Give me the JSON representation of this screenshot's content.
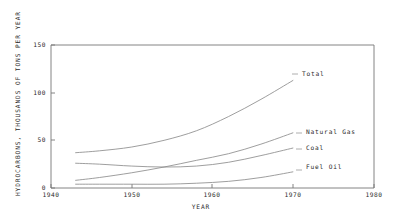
{
  "chart_data": {
    "type": "line",
    "title": "",
    "xlabel": "YEAR",
    "ylabel": "HYDROCARBONS, THOUSANDS OF TONS PER YEAR",
    "xlim": [
      1940,
      1980
    ],
    "ylim": [
      0,
      150
    ],
    "xticks": [
      1940,
      1950,
      1960,
      1970,
      1980
    ],
    "xtick_labels": [
      "1940",
      "1950",
      "1960",
      "1970",
      "1980"
    ],
    "yticks": [
      0,
      50,
      100,
      150
    ],
    "ytick_labels": [
      "0",
      "50",
      "100",
      "150"
    ],
    "grid": false,
    "legend_position": "inline-right-of-curve-ends",
    "series": [
      {
        "name": "Total",
        "label": "Total",
        "x": [
          1943,
          1946,
          1950,
          1954,
          1958,
          1962,
          1966,
          1970
        ],
        "values": [
          37,
          39,
          43,
          50,
          60,
          75,
          93,
          113
        ]
      },
      {
        "name": "Natural Gas",
        "label": "Natural Gas",
        "x": [
          1943,
          1946,
          1950,
          1954,
          1958,
          1962,
          1966,
          1970
        ],
        "values": [
          8,
          11,
          16,
          22,
          29,
          36,
          46,
          58
        ]
      },
      {
        "name": "Coal",
        "label": "Coal",
        "x": [
          1943,
          1946,
          1950,
          1954,
          1958,
          1962,
          1966,
          1970
        ],
        "values": [
          26,
          25,
          23,
          22,
          23,
          27,
          34,
          42
        ]
      },
      {
        "name": "Fuel Oil",
        "label": "Fuel Oil",
        "x": [
          1943,
          1946,
          1950,
          1954,
          1958,
          1962,
          1966,
          1970
        ],
        "values": [
          4,
          4,
          4,
          4,
          5,
          7,
          11,
          17
        ]
      }
    ]
  }
}
